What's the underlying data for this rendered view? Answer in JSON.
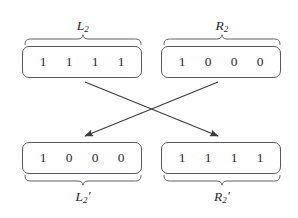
{
  "figure": {
    "type": "diagram",
    "background_color": "#ffffff",
    "stroke_color": "#5a5a5a",
    "text_color": "#2e2e2e",
    "arrow_color": "#3c3c3c"
  },
  "registers": [
    {
      "id": "top-left",
      "label_base": "L",
      "label_sub": "2",
      "label_prime": "",
      "label_text": "L2",
      "brace_side": "top",
      "bits": [
        "1",
        "1",
        "1",
        "1"
      ]
    },
    {
      "id": "top-right",
      "label_base": "R",
      "label_sub": "2",
      "label_prime": "",
      "label_text": "R2",
      "brace_side": "top",
      "bits": [
        "1",
        "0",
        "0",
        "0"
      ]
    },
    {
      "id": "bottom-left",
      "label_base": "L",
      "label_sub": "2",
      "label_prime": "′",
      "label_text": "L2′",
      "brace_side": "bottom",
      "bits": [
        "1",
        "0",
        "0",
        "0"
      ]
    },
    {
      "id": "bottom-right",
      "label_base": "R",
      "label_sub": "2",
      "label_prime": "′",
      "label_text": "R2′",
      "brace_side": "bottom",
      "bits": [
        "1",
        "1",
        "1",
        "1"
      ]
    }
  ],
  "arrows": [
    {
      "id": "left-to-right",
      "from": "top-left",
      "to": "bottom-right",
      "direction": "down-right"
    },
    {
      "id": "right-to-left",
      "from": "top-right",
      "to": "bottom-left",
      "direction": "down-left"
    }
  ]
}
